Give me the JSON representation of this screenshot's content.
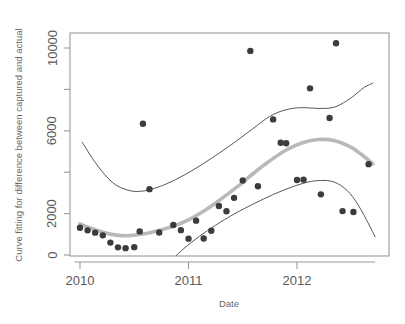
{
  "chart_data": {
    "type": "scatter",
    "title": "",
    "subtitle": "",
    "xlabel": "Date",
    "ylabel": "Curve fitting for difference between captured and actual",
    "xlim": [
      2009.91,
      2012.76
    ],
    "ylim": [
      -420,
      10900
    ],
    "grid": false,
    "legend": null,
    "xticks": [
      "2010",
      "2011",
      "2012"
    ],
    "xtick_values": [
      2010,
      2011,
      2012
    ],
    "yticks": [
      "0",
      "2000",
      "6000",
      "10000"
    ],
    "ytick_values": [
      0,
      2000,
      6000,
      10000
    ],
    "yticks_minor_values": [
      4000,
      8000
    ],
    "colors": {
      "point": "#3c3c3c",
      "fitted_curve": "#b9b9b9",
      "confidence_band": "#585858",
      "axis": "#9a9a9a",
      "text": "#5a5a5a",
      "background": "#ffffff"
    },
    "series": [
      {
        "name": "Observed difference",
        "type": "scatter",
        "marker": "filled-circle",
        "points": [
          {
            "x": 2010.0,
            "y": 1320
          },
          {
            "x": 2010.07,
            "y": 1190
          },
          {
            "x": 2010.14,
            "y": 1080
          },
          {
            "x": 2010.21,
            "y": 950
          },
          {
            "x": 2010.28,
            "y": 600
          },
          {
            "x": 2010.35,
            "y": 370
          },
          {
            "x": 2010.42,
            "y": 330
          },
          {
            "x": 2010.5,
            "y": 380
          },
          {
            "x": 2010.55,
            "y": 1140
          },
          {
            "x": 2010.58,
            "y": 6340
          },
          {
            "x": 2010.64,
            "y": 3180
          },
          {
            "x": 2010.73,
            "y": 1090
          },
          {
            "x": 2010.86,
            "y": 1450
          },
          {
            "x": 2010.93,
            "y": 1200
          },
          {
            "x": 2011.0,
            "y": 790
          },
          {
            "x": 2011.07,
            "y": 1660
          },
          {
            "x": 2011.14,
            "y": 800
          },
          {
            "x": 2011.21,
            "y": 1170
          },
          {
            "x": 2011.28,
            "y": 2370
          },
          {
            "x": 2011.35,
            "y": 2110
          },
          {
            "x": 2011.42,
            "y": 2760
          },
          {
            "x": 2011.5,
            "y": 3600
          },
          {
            "x": 2011.57,
            "y": 9860
          },
          {
            "x": 2011.64,
            "y": 3320
          },
          {
            "x": 2011.78,
            "y": 6550
          },
          {
            "x": 2011.85,
            "y": 5420
          },
          {
            "x": 2011.9,
            "y": 5400
          },
          {
            "x": 2012.0,
            "y": 3620
          },
          {
            "x": 2012.06,
            "y": 3640
          },
          {
            "x": 2012.12,
            "y": 8050
          },
          {
            "x": 2012.22,
            "y": 2930
          },
          {
            "x": 2012.3,
            "y": 6620
          },
          {
            "x": 2012.36,
            "y": 10230
          },
          {
            "x": 2012.42,
            "y": 2120
          },
          {
            "x": 2012.52,
            "y": 2080
          },
          {
            "x": 2012.66,
            "y": 4390
          }
        ]
      },
      {
        "name": "Fitted curve",
        "type": "line",
        "style": "thick-gray",
        "points": [
          {
            "x": 2010.0,
            "y": 1500
          },
          {
            "x": 2010.1,
            "y": 1290
          },
          {
            "x": 2010.22,
            "y": 1090
          },
          {
            "x": 2010.34,
            "y": 960
          },
          {
            "x": 2010.46,
            "y": 935
          },
          {
            "x": 2010.58,
            "y": 1010
          },
          {
            "x": 2010.7,
            "y": 1150
          },
          {
            "x": 2010.85,
            "y": 1370
          },
          {
            "x": 2011.0,
            "y": 1700
          },
          {
            "x": 2011.15,
            "y": 2150
          },
          {
            "x": 2011.3,
            "y": 2700
          },
          {
            "x": 2011.45,
            "y": 3300
          },
          {
            "x": 2011.6,
            "y": 3950
          },
          {
            "x": 2011.75,
            "y": 4550
          },
          {
            "x": 2011.9,
            "y": 5070
          },
          {
            "x": 2012.05,
            "y": 5420
          },
          {
            "x": 2012.2,
            "y": 5580
          },
          {
            "x": 2012.35,
            "y": 5520
          },
          {
            "x": 2012.5,
            "y": 5200
          },
          {
            "x": 2012.6,
            "y": 4830
          },
          {
            "x": 2012.7,
            "y": 4400
          }
        ]
      },
      {
        "name": "Upper confidence band",
        "type": "line",
        "style": "thin-dark",
        "points": [
          {
            "x": 2010.02,
            "y": 5450
          },
          {
            "x": 2010.15,
            "y": 4400
          },
          {
            "x": 2010.3,
            "y": 3500
          },
          {
            "x": 2010.45,
            "y": 3120
          },
          {
            "x": 2010.58,
            "y": 3090
          },
          {
            "x": 2010.72,
            "y": 3280
          },
          {
            "x": 2010.88,
            "y": 3640
          },
          {
            "x": 2011.05,
            "y": 4130
          },
          {
            "x": 2011.22,
            "y": 4700
          },
          {
            "x": 2011.4,
            "y": 5350
          },
          {
            "x": 2011.58,
            "y": 6050
          },
          {
            "x": 2011.75,
            "y": 6700
          },
          {
            "x": 2011.9,
            "y": 7020
          },
          {
            "x": 2012.05,
            "y": 7120
          },
          {
            "x": 2012.2,
            "y": 7080
          },
          {
            "x": 2012.35,
            "y": 7150
          },
          {
            "x": 2012.5,
            "y": 7600
          },
          {
            "x": 2012.62,
            "y": 8100
          },
          {
            "x": 2012.7,
            "y": 8300
          }
        ]
      },
      {
        "name": "Lower confidence band",
        "type": "line",
        "style": "thin-dark",
        "points": [
          {
            "x": 2010.82,
            "y": -380
          },
          {
            "x": 2010.95,
            "y": 280
          },
          {
            "x": 2011.1,
            "y": 900
          },
          {
            "x": 2011.25,
            "y": 1440
          },
          {
            "x": 2011.42,
            "y": 1980
          },
          {
            "x": 2011.6,
            "y": 2470
          },
          {
            "x": 2011.78,
            "y": 2920
          },
          {
            "x": 2011.95,
            "y": 3280
          },
          {
            "x": 2012.1,
            "y": 3520
          },
          {
            "x": 2012.22,
            "y": 3600
          },
          {
            "x": 2012.34,
            "y": 3530
          },
          {
            "x": 2012.46,
            "y": 3130
          },
          {
            "x": 2012.56,
            "y": 2450
          },
          {
            "x": 2012.66,
            "y": 1500
          },
          {
            "x": 2012.72,
            "y": 880
          }
        ]
      }
    ]
  }
}
